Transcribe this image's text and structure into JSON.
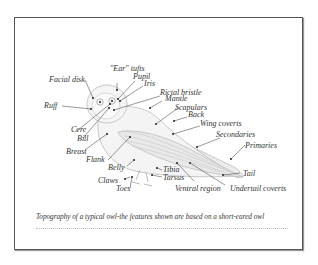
{
  "figure": {
    "caption": "Topography of a typical owl-the features shown are based on a short-eared owl",
    "subject": "short-eared owl",
    "labels": [
      {
        "id": "ear-tufts",
        "text": "\"Ear\" tufts"
      },
      {
        "id": "pupil",
        "text": "Pupil"
      },
      {
        "id": "iris",
        "text": "Iris"
      },
      {
        "id": "facial-disk",
        "text": "Facial disk"
      },
      {
        "id": "rictal-bristle",
        "text": "Rictal bristle"
      },
      {
        "id": "mantle",
        "text": "Mantle"
      },
      {
        "id": "scapulars",
        "text": "Scapulars"
      },
      {
        "id": "back",
        "text": "Back"
      },
      {
        "id": "ruff",
        "text": "Ruff"
      },
      {
        "id": "wing-coverts",
        "text": "Wing coverts"
      },
      {
        "id": "secondaries",
        "text": "Secondaries"
      },
      {
        "id": "cere",
        "text": "Cere"
      },
      {
        "id": "bill",
        "text": "Bill"
      },
      {
        "id": "breast",
        "text": "Breast"
      },
      {
        "id": "primaries",
        "text": "Primaries"
      },
      {
        "id": "flank",
        "text": "Flank"
      },
      {
        "id": "belly",
        "text": "Belly"
      },
      {
        "id": "tibia",
        "text": "Tibia"
      },
      {
        "id": "tarsus",
        "text": "Tarsus"
      },
      {
        "id": "tail",
        "text": "Tail"
      },
      {
        "id": "claws",
        "text": "Claws"
      },
      {
        "id": "toes",
        "text": "Toes"
      },
      {
        "id": "ventral-region",
        "text": "Ventral region"
      },
      {
        "id": "undertail-coverts",
        "text": "Undertail coverts"
      }
    ]
  }
}
